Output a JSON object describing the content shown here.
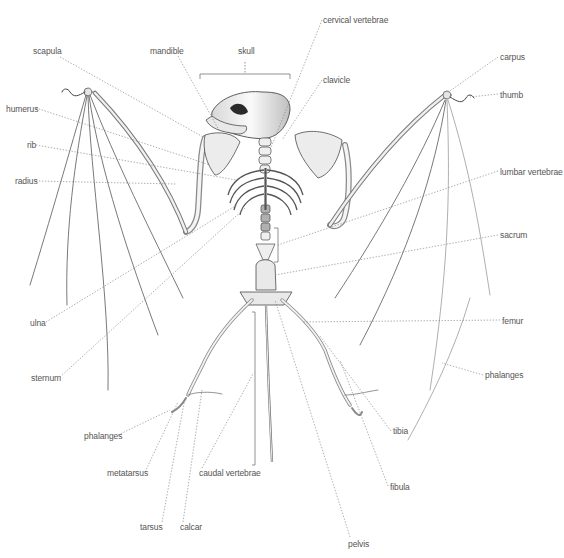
{
  "diagram": {
    "colors": {
      "background": "#ffffff",
      "label": "#555555",
      "leader": "#8a8a8a",
      "bone_stroke": "#5a5a5a",
      "bone_fill": "#f2f2f2"
    },
    "labels": [
      {
        "id": "scapula",
        "text": "scapula",
        "x": 33,
        "y": 46,
        "anchor": [
          205,
          138
        ]
      },
      {
        "id": "mandible",
        "text": "mandible",
        "x": 150,
        "y": 46,
        "anchor": [
          220,
          132
        ]
      },
      {
        "id": "skull",
        "text": "skull",
        "x": 238,
        "y": 46,
        "anchor": [
          245,
          74
        ]
      },
      {
        "id": "cervical-vertebrae",
        "text": "cervical vertebrae",
        "x": 323,
        "y": 15,
        "anchor": [
          270,
          150
        ]
      },
      {
        "id": "clavicle",
        "text": "clavicle",
        "x": 323,
        "y": 75,
        "anchor": [
          282,
          140
        ]
      },
      {
        "id": "carpus",
        "text": "carpus",
        "x": 500,
        "y": 52,
        "anchor": [
          447,
          93
        ]
      },
      {
        "id": "thumb",
        "text": "thumb",
        "x": 500,
        "y": 90,
        "anchor": [
          470,
          97
        ]
      },
      {
        "id": "humerus",
        "text": "humerus",
        "x": 6,
        "y": 104,
        "anchor": [
          210,
          165
        ]
      },
      {
        "id": "rib",
        "text": "rib",
        "x": 27,
        "y": 140,
        "anchor": [
          236,
          180
        ]
      },
      {
        "id": "radius",
        "text": "radius",
        "x": 15,
        "y": 176,
        "anchor": [
          176,
          184
        ]
      },
      {
        "id": "lumbar-vertebrae",
        "text": "lumbar vertebrae",
        "x": 500,
        "y": 167,
        "anchor": [
          278,
          245
        ]
      },
      {
        "id": "sacrum",
        "text": "sacrum",
        "x": 500,
        "y": 230,
        "anchor": [
          275,
          275
        ]
      },
      {
        "id": "ulna",
        "text": "ulna",
        "x": 30,
        "y": 318,
        "anchor": [
          237,
          205
        ]
      },
      {
        "id": "femur",
        "text": "femur",
        "x": 502,
        "y": 316,
        "anchor": [
          302,
          322
        ]
      },
      {
        "id": "sternum",
        "text": "sternum",
        "x": 31,
        "y": 373,
        "anchor": [
          245,
          208
        ]
      },
      {
        "id": "phalanges-right",
        "text": "phalanges",
        "x": 485,
        "y": 370,
        "anchor": [
          442,
          363
        ]
      },
      {
        "id": "phalanges-left",
        "text": "phalanges",
        "x": 84,
        "y": 431,
        "anchor": [
          170,
          410
        ]
      },
      {
        "id": "tibia",
        "text": "tibia",
        "x": 393,
        "y": 426,
        "anchor": [
          320,
          336
        ]
      },
      {
        "id": "metatarsus",
        "text": "metatarsus",
        "x": 107,
        "y": 468,
        "anchor": [
          178,
          402
        ]
      },
      {
        "id": "caudal-vertebrae",
        "text": "caudal vertebrae",
        "x": 199,
        "y": 468,
        "anchor": [
          253,
          374
        ]
      },
      {
        "id": "fibula",
        "text": "fibula",
        "x": 390,
        "y": 482,
        "anchor": [
          340,
          360
        ]
      },
      {
        "id": "tarsus",
        "text": "tarsus",
        "x": 140,
        "y": 522,
        "anchor": [
          185,
          398
        ]
      },
      {
        "id": "calcar",
        "text": "calcar",
        "x": 180,
        "y": 522,
        "anchor": [
          202,
          390
        ]
      },
      {
        "id": "pelvis",
        "text": "pelvis",
        "x": 348,
        "y": 539,
        "anchor": [
          275,
          300
        ]
      }
    ],
    "brackets": [
      {
        "id": "skull-bracket",
        "x1": 200,
        "x2": 290,
        "y": 74
      },
      {
        "id": "lumbar-bracket",
        "x": 278,
        "y1": 228,
        "y2": 262
      },
      {
        "id": "caudal-bracket",
        "x": 255,
        "y1": 312,
        "y2": 465
      }
    ]
  }
}
